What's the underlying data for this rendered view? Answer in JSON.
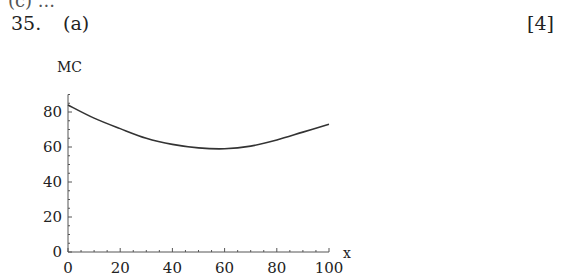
{
  "header": {
    "partial_line": "(c) ...",
    "question_number": "35.",
    "question_part": "(a)",
    "marks": "[4]"
  },
  "chart_data": {
    "type": "line",
    "title": "",
    "xlabel": "x",
    "ylabel": "MC",
    "xlim": [
      0,
      100
    ],
    "ylim": [
      0,
      90
    ],
    "x_ticks": [
      0,
      20,
      40,
      60,
      80,
      100
    ],
    "y_ticks": [
      0,
      20,
      40,
      60,
      80
    ],
    "grid": false,
    "legend": null,
    "series": [
      {
        "name": "MC",
        "x": [
          0,
          10,
          20,
          30,
          40,
          50,
          60,
          70,
          80,
          90,
          100
        ],
        "values": [
          84,
          76.5,
          70.5,
          65,
          61.5,
          59.5,
          59,
          60.5,
          64,
          68.5,
          73
        ]
      }
    ]
  }
}
